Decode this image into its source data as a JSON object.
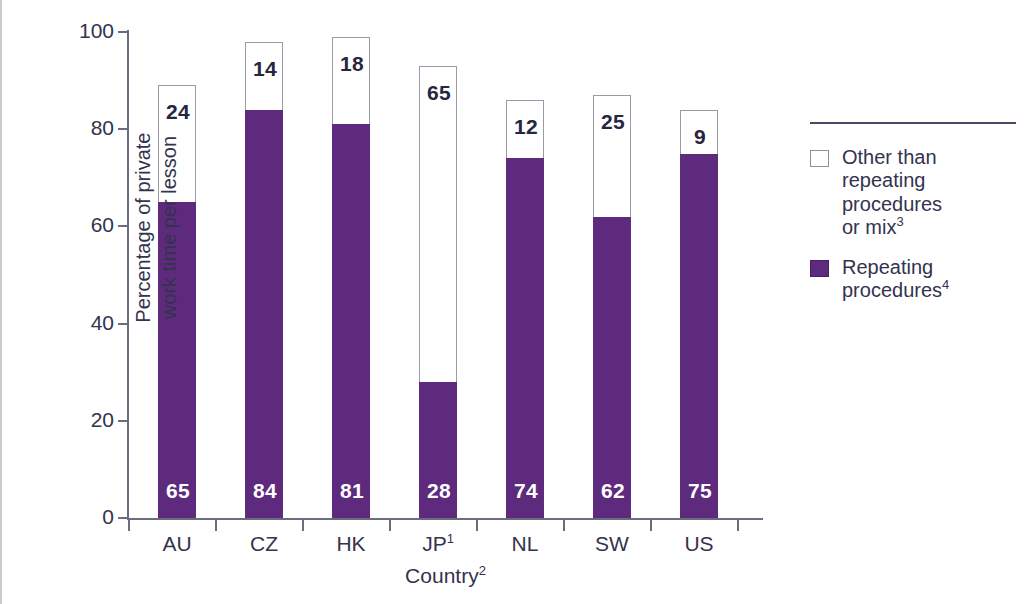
{
  "chart_data": {
    "type": "bar",
    "subtype": "stacked-bar",
    "title": "",
    "xlabel": "Country2",
    "xlabel_text": "Country",
    "xlabel_superscript": "2",
    "ylabel": "Percentage of private\nwork time per lesson",
    "ylim": [
      0,
      100
    ],
    "yticks": [
      0,
      20,
      40,
      60,
      80,
      100
    ],
    "ytick_labels": [
      "0",
      "20",
      "40",
      "60",
      "80",
      "100"
    ],
    "grid": false,
    "legend_position": "right",
    "categories": [
      "AU",
      "CZ",
      "HK",
      "JP",
      "NL",
      "SW",
      "US"
    ],
    "category_labels": [
      "AU",
      "CZ",
      "HK",
      "JP1",
      "NL",
      "SW",
      "US"
    ],
    "category_superscripts": [
      "",
      "",
      "",
      "1",
      "",
      "",
      ""
    ],
    "series": [
      {
        "name": "Repeating procedures4",
        "legend_text": "Repeating\nprocedures",
        "legend_superscript": "4",
        "color": "#5d2a7e",
        "label_color": "#ffffff",
        "values": [
          65,
          84,
          81,
          28,
          74,
          62,
          75
        ]
      },
      {
        "name": "Other than repeating procedures or mix3",
        "legend_text": "Other than\nrepeating\nprocedures\nor mix",
        "legend_superscript": "3",
        "color": "#ffffff",
        "label_color": "#262640",
        "values": [
          24,
          14,
          18,
          65,
          12,
          25,
          9
        ]
      }
    ],
    "totals": [
      89,
      98,
      99,
      93,
      86,
      87,
      84
    ],
    "stack_order": [
      "Repeating procedures4",
      "Other than repeating procedures or mix3"
    ]
  },
  "colors": {
    "purple": "#5d2a7e",
    "axis": "#6c6c80",
    "text": "#33334d",
    "legend_rule": "#4a4a66",
    "bar_outline": "#9a9aa8"
  }
}
